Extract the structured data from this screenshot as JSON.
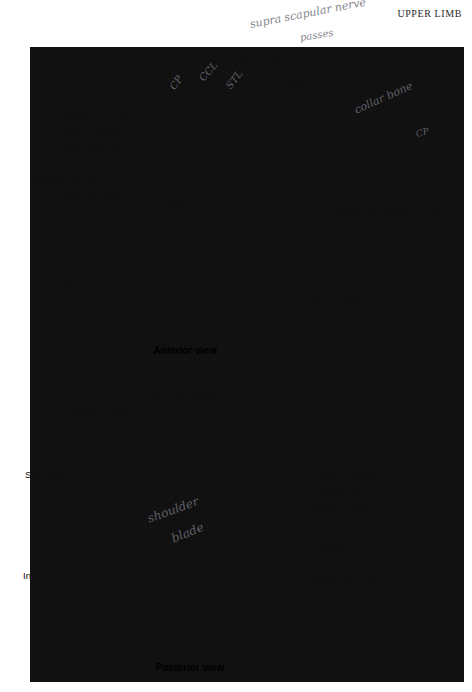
{
  "page": {
    "running_head": "UPPER LIMB",
    "panel_color": "#b5b5b5",
    "page_color": "#ffffff",
    "label_color": "#101010",
    "handwriting_color": "#6f6f78"
  },
  "handwriting": [
    {
      "text": "supra scapular nerve",
      "x": 250,
      "y": 18,
      "rotate": -11,
      "size": 11
    },
    {
      "text": "passes",
      "x": 300,
      "y": 32,
      "rotate": -9,
      "size": 10
    },
    {
      "text": "CP",
      "x": 172,
      "y": 83,
      "rotate": -55,
      "size": 10
    },
    {
      "text": "CCL",
      "x": 201,
      "y": 74,
      "rotate": -48,
      "size": 10
    },
    {
      "text": "STL",
      "x": 228,
      "y": 82,
      "rotate": -52,
      "size": 10
    },
    {
      "text": "collar bone",
      "x": 355,
      "y": 104,
      "rotate": -24,
      "size": 11
    },
    {
      "text": "CP",
      "x": 416,
      "y": 129,
      "rotate": -14,
      "size": 9
    },
    {
      "text": "shoulder",
      "x": 148,
      "y": 512,
      "rotate": -20,
      "size": 12
    },
    {
      "text": "blade",
      "x": 172,
      "y": 532,
      "rotate": -22,
      "size": 12
    }
  ],
  "anterior": {
    "caption": "Anterior view",
    "labels": [
      {
        "key": "acromion",
        "text": "Acromion",
        "x": 129,
        "y": 64,
        "align": "left"
      },
      {
        "key": "scapular-notch",
        "text": "Scapular notch",
        "x": 226,
        "y": 52,
        "align": "left"
      },
      {
        "key": "clavicle",
        "text": "Clavicle",
        "x": 281,
        "y": 76,
        "align": "left"
      },
      {
        "key": "coracoid-process",
        "text": "Coracoid process",
        "x": 56,
        "y": 111,
        "align": "left"
      },
      {
        "key": "greater-tubercle",
        "text": "Greater tubercle",
        "x": 56,
        "y": 127,
        "align": "left"
      },
      {
        "key": "lesser-tubercle",
        "text": "Lesser tubercle",
        "x": 56,
        "y": 143,
        "align": "left"
      },
      {
        "key": "intertubercular-sulcus",
        "text": "Intertubercular sulcus",
        "x": 32,
        "y": 162,
        "align": "left"
      },
      {
        "key": "bicipital-groove",
        "text": "(bicipital groove)",
        "x": 32,
        "y": 174,
        "align": "left"
      },
      {
        "key": "surgical-neck",
        "text": "Surgical neck",
        "x": 63,
        "y": 191,
        "align": "left"
      },
      {
        "key": "humerus",
        "text": "Humerus",
        "x": 92,
        "y": 208,
        "align": "left"
      },
      {
        "key": "neck-of-scapula",
        "text": "Neck of",
        "x": 165,
        "y": 199,
        "align": "left"
      },
      {
        "key": "neck-of-scapula-2",
        "text": "scapula",
        "x": 163,
        "y": 211,
        "align": "left"
      },
      {
        "key": "subscapular-fossa",
        "text": "Subscapular fossa",
        "x": 337,
        "y": 176,
        "align": "left"
      },
      {
        "key": "medial-border",
        "text": "Medial (vertebral) border",
        "x": 337,
        "y": 205,
        "align": "left"
      },
      {
        "key": "deltoid-tuberosity",
        "text": "Deltoid tuberosity",
        "x": 52,
        "y": 280,
        "align": "left"
      },
      {
        "key": "inferior-angle",
        "text": "Inferior angle",
        "x": 306,
        "y": 292,
        "align": "left"
      },
      {
        "key": "lateral-border",
        "text": "Lateral (axillary) border",
        "x": 112,
        "y": 322,
        "align": "left"
      }
    ]
  },
  "posterior": {
    "caption": "Posterior view",
    "labels": [
      {
        "key": "spine-of-scapula",
        "text": "Spine of scapula",
        "x": 146,
        "y": 391,
        "align": "left"
      },
      {
        "key": "acromioclavicular",
        "text": "Acromioclavicular joint",
        "x": 253,
        "y": 392,
        "align": "left"
      },
      {
        "key": "superior-angle",
        "text": "Superior angle",
        "x": 68,
        "y": 404,
        "align": "left"
      },
      {
        "key": "acromion",
        "text": "Acromion",
        "x": 297,
        "y": 432,
        "align": "left"
      },
      {
        "key": "head",
        "text": "Head",
        "x": 297,
        "y": 450,
        "align": "left"
      },
      {
        "key": "supraspinous-fossa",
        "text": "Supraspinous",
        "x": 25,
        "y": 469,
        "align": "left"
      },
      {
        "key": "supraspinous-fossa-2",
        "text": "fossa",
        "x": 66,
        "y": 481,
        "align": "left"
      },
      {
        "key": "greater-tubercle",
        "text": "Greater tubercle",
        "x": 312,
        "y": 468,
        "align": "left"
      },
      {
        "key": "anatomical-neck",
        "text": "Anatomical neck",
        "x": 312,
        "y": 486,
        "align": "left"
      },
      {
        "key": "surgical-neck",
        "text": "Surgical neck",
        "x": 312,
        "y": 503,
        "align": "left"
      },
      {
        "key": "infraglenoid-tubercle",
        "text": "Infraglenoid tubercle",
        "x": 306,
        "y": 522,
        "align": "left"
      },
      {
        "key": "humerus",
        "text": "Humerus",
        "x": 306,
        "y": 540,
        "align": "left"
      },
      {
        "key": "deltoid-tuberosity",
        "text": "Deltoid tuberosity",
        "x": 306,
        "y": 573,
        "align": "left"
      },
      {
        "key": "infraspinous-fossa",
        "text": "Infraspinous fossa",
        "x": 23,
        "y": 570,
        "align": "left"
      },
      {
        "key": "inferior-angle",
        "text": "Inferior angle",
        "x": 160,
        "y": 641,
        "align": "left"
      }
    ]
  },
  "captions": {
    "anterior": {
      "text": "Anterior view",
      "x": 185,
      "y": 345
    },
    "posterior": {
      "text": "Posterior view",
      "x": 185,
      "y": 668
    }
  }
}
